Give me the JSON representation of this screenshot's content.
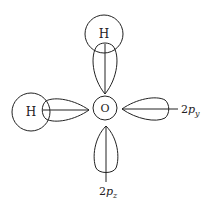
{
  "diagram": {
    "atoms": {
      "oxygen": {
        "label": "O",
        "cx": 105,
        "cy": 108,
        "r": 12
      },
      "hydrogen_top": {
        "label": "H",
        "cx": 104,
        "cy": 34,
        "r": 19
      },
      "hydrogen_left": {
        "label": "H",
        "cx": 31,
        "cy": 112,
        "r": 19
      }
    },
    "orbital_labels": {
      "py": {
        "base": "2",
        "p": "p",
        "sub": "y"
      },
      "pz": {
        "base": "2",
        "p": "p",
        "sub": "z"
      }
    },
    "colors": {
      "stroke": "#222222",
      "background": "#ffffff"
    }
  }
}
